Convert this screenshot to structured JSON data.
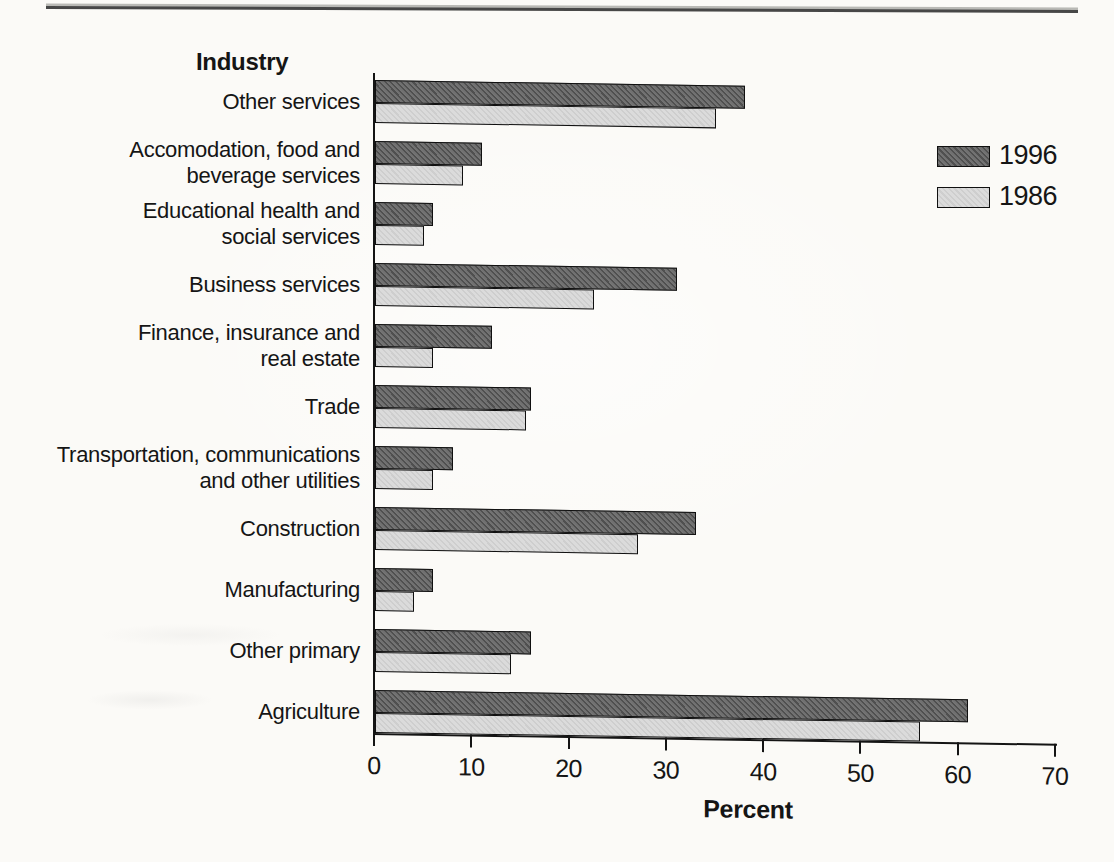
{
  "page": {
    "kind": "scanned statistical chart page"
  },
  "chart_data": {
    "type": "bar",
    "orientation": "horizontal",
    "title": "Industry",
    "xlabel": "Percent",
    "xlim": [
      0,
      70
    ],
    "xticks": [
      0,
      10,
      20,
      30,
      40,
      50,
      60,
      70
    ],
    "grid": false,
    "legend_position": "right",
    "categories": [
      "Other services",
      "Accomodation, food and beverage services",
      "Educational health and social services",
      "Business services",
      "Finance, insurance and real estate",
      "Trade",
      "Transportation, communications and other utilities",
      "Construction",
      "Manufacturing",
      "Other primary",
      "Agriculture"
    ],
    "category_label_lines": [
      [
        "Other services"
      ],
      [
        "Accomodation, food and",
        "beverage services"
      ],
      [
        "Educational health and",
        "social services"
      ],
      [
        "Business services"
      ],
      [
        "Finance, insurance and",
        "real estate"
      ],
      [
        "Trade"
      ],
      [
        "Transportation, communications",
        "and other utilities"
      ],
      [
        "Construction"
      ],
      [
        "Manufacturing"
      ],
      [
        "Other primary"
      ],
      [
        "Agriculture"
      ]
    ],
    "series": [
      {
        "name": "1996",
        "color": "#6d6d6d",
        "values": [
          38,
          11,
          6,
          31,
          12,
          16,
          8,
          33,
          6,
          16,
          61
        ]
      },
      {
        "name": "1986",
        "color": "#dbdbdb",
        "values": [
          35,
          9,
          5,
          22.5,
          6,
          15.5,
          6,
          27,
          4,
          14,
          56
        ]
      }
    ],
    "ink_color": "#141414"
  }
}
